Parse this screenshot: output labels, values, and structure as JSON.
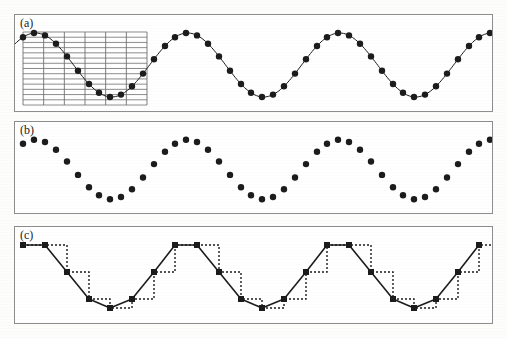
{
  "figure": {
    "width": 507,
    "height": 338,
    "background_color": "#fdfdfc",
    "panel_border_color": "#8d8d8d",
    "ink_color": "#1b1b1b",
    "grid_color": "#6f6f6f"
  },
  "panels": [
    {
      "id": "a",
      "label": "(a)",
      "name": "continuous-signal-with-sampling-grid",
      "x": 14,
      "y": 14,
      "width": 479,
      "height": 98
    },
    {
      "id": "b",
      "label": "(b)",
      "name": "sampled-points-only",
      "x": 14,
      "y": 121,
      "width": 479,
      "height": 93
    },
    {
      "id": "c",
      "label": "(c)",
      "name": "quantized-staircase-reconstruction",
      "x": 14,
      "y": 226,
      "width": 479,
      "height": 98
    }
  ],
  "chart_data": [
    {
      "type": "line",
      "panel": "a",
      "title": "(a)",
      "xlabel": "",
      "ylabel": "",
      "grid": true,
      "grid_region": {
        "x0": 22,
        "x1": 146,
        "y0": 31,
        "y1": 104,
        "vertical_lines": 7,
        "horizontal_lines": 15
      },
      "xlim": [
        0,
        479
      ],
      "ylim": [
        0,
        98
      ],
      "curve": {
        "name": "continuous-sine",
        "equation": "y = 50 - 32*sin(2*pi*x/152 + 0.72)",
        "amplitude": 32,
        "period": 152,
        "phase": 0.72,
        "offset": 50,
        "style": "solid"
      },
      "series": [
        {
          "name": "sample-points",
          "style": "markers",
          "marker": "filled-circle",
          "marker_size": 3.2,
          "points_x": [
            8,
            19,
            30,
            41,
            52,
            63,
            74,
            84,
            95,
            106,
            117,
            128,
            139,
            150,
            160,
            171,
            182,
            193,
            204,
            215,
            226,
            236,
            247,
            258,
            269,
            280,
            291,
            302,
            312,
            323,
            334,
            345,
            356,
            367,
            378,
            388,
            399,
            410,
            421,
            432,
            443,
            454,
            464,
            475
          ],
          "points_y": [
            50,
            36,
            25,
            19,
            18,
            24,
            34,
            47,
            60,
            71,
            78,
            81,
            79,
            72,
            62,
            50,
            38,
            27,
            20,
            18,
            21,
            30,
            42,
            55,
            67,
            76,
            81,
            81,
            75,
            66,
            54,
            41,
            29,
            21,
            18,
            21,
            29,
            41,
            54,
            66,
            75,
            81,
            81,
            76
          ]
        }
      ]
    },
    {
      "type": "scatter",
      "panel": "b",
      "title": "(b)",
      "xlabel": "",
      "ylabel": "",
      "grid": false,
      "xlim": [
        0,
        479
      ],
      "ylim": [
        0,
        93
      ],
      "series": [
        {
          "name": "discrete-samples",
          "style": "markers",
          "marker": "filled-circle",
          "marker_size": 3.2,
          "points_x": [
            8,
            30,
            52,
            74,
            95,
            117,
            139,
            160,
            182,
            204,
            226,
            247,
            269,
            291,
            312,
            334,
            356,
            378,
            399,
            421,
            443,
            464,
            19,
            41,
            63,
            84,
            106,
            128,
            150,
            171,
            193,
            215,
            236,
            258,
            280,
            302,
            323,
            345,
            367,
            388,
            410,
            432,
            454,
            475
          ],
          "points_y": [
            48,
            23,
            18,
            33,
            58,
            74,
            76,
            60,
            36,
            19,
            21,
            40,
            64,
            77,
            72,
            52,
            28,
            18,
            28,
            52,
            72,
            76,
            35,
            17,
            24,
            46,
            68,
            77,
            69,
            49,
            26,
            17,
            30,
            52,
            73,
            77,
            66,
            45,
            22,
            17,
            33,
            57,
            74,
            78
          ]
        }
      ]
    },
    {
      "type": "line",
      "panel": "c",
      "title": "(c)",
      "xlabel": "",
      "ylabel": "",
      "grid": false,
      "xlim": [
        0,
        479
      ],
      "ylim": [
        0,
        98
      ],
      "quantization_step": 9,
      "series": [
        {
          "name": "interpolated-polyline",
          "style": "solid",
          "line_width": 1.6,
          "marker": "filled-square",
          "marker_size": 3.0,
          "points_x": [
            8,
            30,
            52,
            74,
            95,
            117,
            139,
            160,
            182,
            204,
            226,
            247,
            269,
            291,
            312,
            334,
            356,
            378,
            399,
            421,
            443,
            464
          ],
          "points_y": [
            52,
            28,
            19,
            34,
            60,
            76,
            78,
            62,
            38,
            21,
            23,
            42,
            66,
            78,
            74,
            55,
            30,
            19,
            30,
            55,
            74,
            78
          ]
        },
        {
          "name": "sample-and-hold-staircase",
          "style": "dotted",
          "line_width": 1.4,
          "points_x": [
            8,
            30,
            52,
            74,
            95,
            117,
            139,
            160,
            182,
            204,
            226,
            247,
            269,
            291,
            312,
            334,
            356,
            378,
            399,
            421,
            443,
            464,
            479
          ],
          "points_y": [
            52,
            28,
            19,
            34,
            60,
            76,
            78,
            62,
            38,
            21,
            23,
            42,
            66,
            78,
            74,
            55,
            30,
            19,
            30,
            55,
            74,
            78,
            78
          ]
        }
      ]
    }
  ]
}
